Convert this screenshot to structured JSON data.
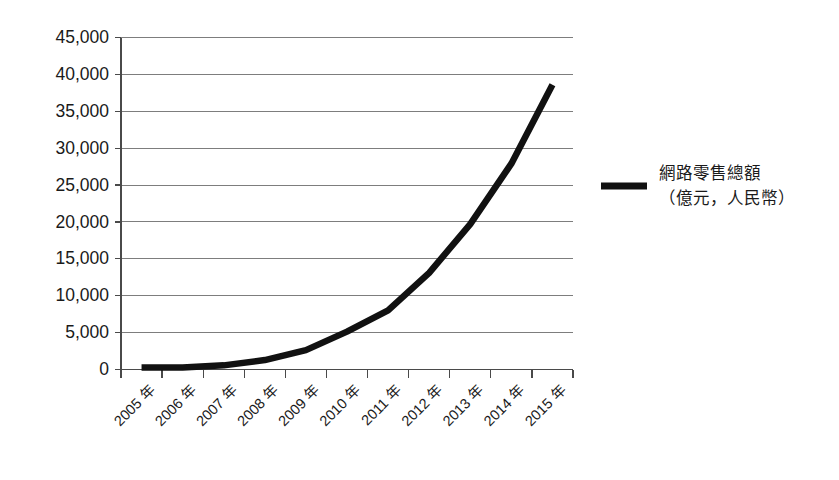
{
  "chart_data": {
    "type": "line",
    "title": "",
    "xlabel": "",
    "ylabel": "",
    "categories": [
      "2005 年",
      "2006 年",
      "2007 年",
      "2008 年",
      "2009 年",
      "2010 年",
      "2011 年",
      "2012 年",
      "2013 年",
      "2014 年",
      "2015 年"
    ],
    "series": [
      {
        "name": "網路零售總額（億元，人民幣）",
        "values": [
          263,
          263,
          561,
          1281,
          2630,
          5131,
          8019,
          13110,
          19700,
          27898,
          38600
        ]
      }
    ],
    "ylim": [
      0,
      45000
    ],
    "ytick_labels": [
      "0",
      "5,000",
      "10,000",
      "15,000",
      "20,000",
      "25,000",
      "30,000",
      "35,000",
      "40,000",
      "45,000"
    ],
    "ytick_values": [
      0,
      5000,
      10000,
      15000,
      20000,
      25000,
      30000,
      35000,
      40000,
      45000
    ],
    "grid": true,
    "legend_position": "right",
    "series_color": "#111111",
    "gridline_color": "#7d7d7d",
    "axis_color": "#4a4a4a",
    "background_color": "#ffffff"
  },
  "legend": {
    "entries": [
      {
        "line1": "網路零售總額",
        "line2": "（億元，人民幣）"
      }
    ]
  }
}
